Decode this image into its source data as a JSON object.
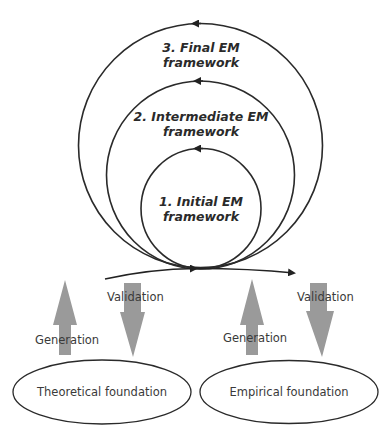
{
  "diagram": {
    "stages": [
      {
        "id": "stage-1",
        "line1": "1. Initial EM",
        "line2": "framework"
      },
      {
        "id": "stage-2",
        "line1": "2. Intermediate EM",
        "line2": "framework"
      },
      {
        "id": "stage-3",
        "line1": "3. Final EM",
        "line2": "framework"
      }
    ],
    "foundations": [
      {
        "id": "theoretical",
        "label": "Theoretical foundation"
      },
      {
        "id": "empirical",
        "label": "Empirical foundation"
      }
    ],
    "flows": {
      "left_generation": "Generation",
      "left_validation": "Validation",
      "right_generation": "Generation",
      "right_validation": "Validation"
    },
    "colors": {
      "line": "#222222",
      "arrow_fill": "#9a9a9a",
      "text": "#2a2a2a"
    }
  }
}
